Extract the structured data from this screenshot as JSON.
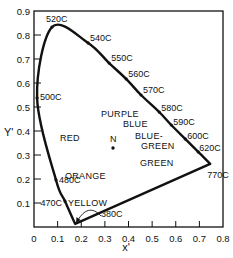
{
  "chart_data": {
    "type": "line",
    "title": "",
    "xlabel": "x'",
    "ylabel": "Y'",
    "xlim": [
      0,
      0.8
    ],
    "ylim": [
      0,
      0.9
    ],
    "grid": false,
    "x_ticks": [
      "0",
      "0.1",
      "0.2",
      "0.3",
      "0.4",
      "0.5",
      "0.6",
      "0.7",
      "0.8"
    ],
    "y_ticks": [
      "0.1",
      "0.2",
      "0.3",
      "0.4",
      "0.5",
      "0.6",
      "0.7",
      "0.8",
      "0.9"
    ],
    "series": [
      {
        "name": "spectrum locus (complementary wavelengths)",
        "closed": true,
        "points": [
          {
            "label": "380C",
            "x": 0.174,
            "y": 0.013
          },
          {
            "label": "470C",
            "x": 0.131,
            "y": 0.108
          },
          {
            "label": "480C",
            "x": 0.093,
            "y": 0.196
          },
          {
            "label": "500C",
            "x": 0.013,
            "y": 0.538
          },
          {
            "label": "520C",
            "x": 0.076,
            "y": 0.833
          },
          {
            "label": "540C",
            "x": 0.229,
            "y": 0.767
          },
          {
            "label": "550C",
            "x": 0.318,
            "y": 0.683
          },
          {
            "label": "560C",
            "x": 0.39,
            "y": 0.617
          },
          {
            "label": "570C",
            "x": 0.453,
            "y": 0.55
          },
          {
            "label": "580C",
            "x": 0.53,
            "y": 0.479
          },
          {
            "label": "590C",
            "x": 0.581,
            "y": 0.425
          },
          {
            "label": "600C",
            "x": 0.64,
            "y": 0.367
          },
          {
            "label": "620C",
            "x": 0.695,
            "y": 0.313
          },
          {
            "label": "770C",
            "x": 0.746,
            "y": 0.263
          }
        ]
      }
    ],
    "neutral_point": {
      "label": "N",
      "x": 0.335,
      "y": 0.329
    },
    "region_labels": [
      {
        "text": "PURPLE",
        "x": 0.31,
        "y": 0.43
      },
      {
        "text": "BLUE",
        "x": 0.34,
        "y": 0.385
      },
      {
        "text": "BLUE-",
        "x": 0.43,
        "y": 0.34
      },
      {
        "text": "GREEN",
        "x": 0.43,
        "y": 0.305
      },
      {
        "text": "RED",
        "x": 0.11,
        "y": 0.34
      },
      {
        "text": "GREEN",
        "x": 0.42,
        "y": 0.25
      },
      {
        "text": "ORANGE",
        "x": 0.13,
        "y": 0.2
      },
      {
        "text": "YELLOW",
        "x": 0.14,
        "y": 0.075
      }
    ],
    "annotations": [
      {
        "text": "380C",
        "note": "curved arrow pointing to lower vertex of locus"
      }
    ]
  },
  "labels": {
    "x_axis_title": "x'",
    "y_axis_title": "Y'",
    "neutral": "N",
    "purple": "PURPLE",
    "blue": "BLUE",
    "blue_green_1": "BLUE-",
    "blue_green_2": "GREEN",
    "red": "RED",
    "green": "GREEN",
    "orange": "ORANGE",
    "yellow": "YELLOW"
  }
}
